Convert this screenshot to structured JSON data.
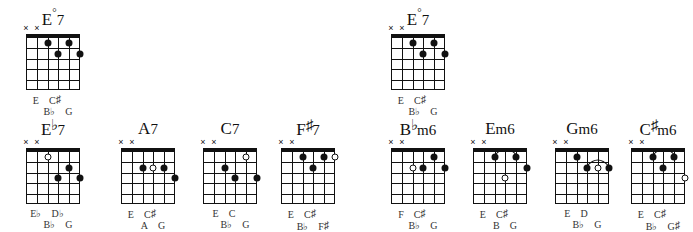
{
  "page": {
    "kind": "guitar-chord-chart",
    "background": "#ffffff",
    "ink": "#111111",
    "grid": {
      "strings": 6,
      "frets": 5,
      "has_nut": true
    }
  },
  "legend": {
    "mute_symbol": "×",
    "filled_dot": "filled",
    "open_dot": "open",
    "arc": "slur"
  },
  "chords": [
    {
      "id": "e-dim7-a",
      "title_parts": {
        "root": "E",
        "quality": "°7",
        "accidental": ""
      },
      "title": "E°7",
      "muted_strings": [
        6,
        5
      ],
      "dots": [
        {
          "string": 4,
          "fret": 1,
          "type": "filled"
        },
        {
          "string": 2,
          "fret": 1,
          "type": "filled"
        },
        {
          "string": 3,
          "fret": 2,
          "type": "filled"
        },
        {
          "string": 1,
          "fret": 2,
          "type": "filled"
        }
      ],
      "arcs": [],
      "notes_upper": [
        "E",
        "C♯"
      ],
      "notes_lower": [
        "B♭",
        "G"
      ]
    },
    {
      "id": "e-dim7-b",
      "title_parts": {
        "root": "E",
        "quality": "°7",
        "accidental": ""
      },
      "title": "E°7",
      "muted_strings": [
        6,
        5
      ],
      "dots": [
        {
          "string": 4,
          "fret": 1,
          "type": "filled"
        },
        {
          "string": 2,
          "fret": 1,
          "type": "filled"
        },
        {
          "string": 3,
          "fret": 2,
          "type": "filled"
        },
        {
          "string": 1,
          "fret": 2,
          "type": "filled"
        }
      ],
      "arcs": [],
      "notes_upper": [
        "E",
        "C♯"
      ],
      "notes_lower": [
        "B♭",
        "G"
      ]
    },
    {
      "id": "eb7",
      "title_parts": {
        "root": "E",
        "accidental": "♭",
        "quality": "7"
      },
      "title": "E♭7",
      "muted_strings": [
        6,
        5
      ],
      "dots": [
        {
          "string": 4,
          "fret": 1,
          "type": "open"
        },
        {
          "string": 2,
          "fret": 2,
          "type": "filled"
        },
        {
          "string": 3,
          "fret": 3,
          "type": "filled"
        },
        {
          "string": 1,
          "fret": 3,
          "type": "filled"
        }
      ],
      "arcs": [],
      "notes_upper": [
        "E♭",
        "D♭"
      ],
      "notes_lower": [
        "B♭",
        "G"
      ]
    },
    {
      "id": "a7",
      "title_parts": {
        "root": "A",
        "accidental": "",
        "quality": "7"
      },
      "title": "A7",
      "muted_strings": [
        6,
        5
      ],
      "dots": [
        {
          "string": 4,
          "fret": 2,
          "type": "filled"
        },
        {
          "string": 3,
          "fret": 2,
          "type": "open"
        },
        {
          "string": 2,
          "fret": 2,
          "type": "filled"
        },
        {
          "string": 1,
          "fret": 3,
          "type": "filled"
        }
      ],
      "arcs": [],
      "notes_upper": [
        "E",
        "C♯"
      ],
      "notes_lower": [
        "A",
        "G"
      ]
    },
    {
      "id": "c7",
      "title_parts": {
        "root": "C",
        "accidental": "",
        "quality": "7"
      },
      "title": "C7",
      "muted_strings": [
        6,
        5
      ],
      "dots": [
        {
          "string": 2,
          "fret": 1,
          "type": "open"
        },
        {
          "string": 4,
          "fret": 2,
          "type": "filled"
        },
        {
          "string": 3,
          "fret": 3,
          "type": "filled"
        },
        {
          "string": 1,
          "fret": 3,
          "type": "filled"
        }
      ],
      "arcs": [],
      "notes_upper": [
        "E",
        "C"
      ],
      "notes_lower": [
        "B♭",
        "G"
      ]
    },
    {
      "id": "fsharp7",
      "title_parts": {
        "root": "F",
        "accidental": "♯",
        "quality": "7"
      },
      "title": "F♯7",
      "muted_strings": [
        6,
        5
      ],
      "dots": [
        {
          "string": 4,
          "fret": 1,
          "type": "filled"
        },
        {
          "string": 2,
          "fret": 1,
          "type": "filled"
        },
        {
          "string": 1,
          "fret": 1,
          "type": "open"
        },
        {
          "string": 3,
          "fret": 2,
          "type": "filled"
        }
      ],
      "arcs": [],
      "notes_upper": [
        "E",
        "C♯"
      ],
      "notes_lower": [
        "B♭",
        "F♯"
      ]
    },
    {
      "id": "bbm6",
      "title_parts": {
        "root": "B",
        "accidental": "♭",
        "quality": "m6"
      },
      "title": "B♭m6",
      "muted_strings": [
        6,
        5
      ],
      "dots": [
        {
          "string": 2,
          "fret": 1,
          "type": "filled"
        },
        {
          "string": 4,
          "fret": 2,
          "type": "open"
        },
        {
          "string": 3,
          "fret": 2,
          "type": "filled"
        },
        {
          "string": 1,
          "fret": 2,
          "type": "filled"
        }
      ],
      "arcs": [],
      "notes_upper": [
        "F",
        "C♯"
      ],
      "notes_lower": [
        "B♭",
        "G"
      ]
    },
    {
      "id": "em6",
      "title_parts": {
        "root": "E",
        "accidental": "",
        "quality": "m6"
      },
      "title": "Em6",
      "muted_strings": [
        6,
        5
      ],
      "dots": [
        {
          "string": 4,
          "fret": 1,
          "type": "filled"
        },
        {
          "string": 2,
          "fret": 1,
          "type": "filled"
        },
        {
          "string": 1,
          "fret": 2,
          "type": "filled"
        },
        {
          "string": 3,
          "fret": 3,
          "type": "open"
        }
      ],
      "arcs": [
        {
          "from_string": 4,
          "to_string": 2,
          "fret": 1
        }
      ],
      "notes_upper": [
        "E",
        "C♯"
      ],
      "notes_lower": [
        "B",
        "G"
      ]
    },
    {
      "id": "gm6",
      "title_parts": {
        "root": "G",
        "accidental": "",
        "quality": "m6"
      },
      "title": "Gm6",
      "muted_strings": [
        6,
        5
      ],
      "dots": [
        {
          "string": 4,
          "fret": 1,
          "type": "filled"
        },
        {
          "string": 3,
          "fret": 2,
          "type": "filled"
        },
        {
          "string": 2,
          "fret": 2,
          "type": "open"
        },
        {
          "string": 1,
          "fret": 2,
          "type": "filled"
        }
      ],
      "arcs": [
        {
          "from_string": 3,
          "to_string": 1,
          "fret": 2
        }
      ],
      "notes_upper": [
        "E",
        "D"
      ],
      "notes_lower": [
        "B♭",
        "G"
      ]
    },
    {
      "id": "csharpm6",
      "title_parts": {
        "root": "C",
        "accidental": "♯",
        "quality": "m6"
      },
      "title": "C♯m6",
      "muted_strings": [
        6,
        5
      ],
      "dots": [
        {
          "string": 4,
          "fret": 1,
          "type": "filled"
        },
        {
          "string": 2,
          "fret": 1,
          "type": "filled"
        },
        {
          "string": 3,
          "fret": 2,
          "type": "filled"
        },
        {
          "string": 1,
          "fret": 3,
          "type": "open"
        }
      ],
      "arcs": [
        {
          "from_string": 4,
          "to_string": 2,
          "fret": 1
        }
      ],
      "notes_upper": [
        "E",
        "C♯"
      ],
      "notes_lower": [
        "B♭",
        "G♯"
      ]
    }
  ],
  "layout": {
    "positions": [
      {
        "id": "e-dim7-a",
        "left": 8,
        "top": 6
      },
      {
        "id": "e-dim7-b",
        "left": 373,
        "top": 6
      },
      {
        "id": "eb7",
        "left": 8,
        "top": 120
      },
      {
        "id": "a7",
        "left": 103,
        "top": 120
      },
      {
        "id": "c7",
        "left": 185,
        "top": 120
      },
      {
        "id": "fsharp7",
        "left": 263,
        "top": 120
      },
      {
        "id": "bbm6",
        "left": 373,
        "top": 120
      },
      {
        "id": "em6",
        "left": 455,
        "top": 120
      },
      {
        "id": "gm6",
        "left": 537,
        "top": 120
      },
      {
        "id": "csharpm6",
        "left": 613,
        "top": 120
      }
    ]
  }
}
